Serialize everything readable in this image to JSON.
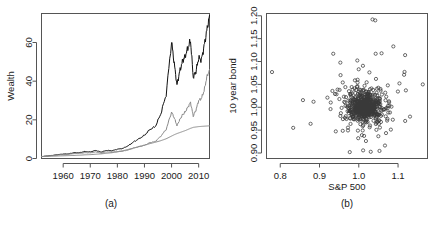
{
  "figure": {
    "panels": [
      {
        "id": "a",
        "caption": "(a)"
      },
      {
        "id": "b",
        "caption": "(b)"
      }
    ]
  },
  "chart_data": [
    {
      "type": "line",
      "panel": "(a)",
      "title": "",
      "xlabel": "",
      "ylabel": "Wealth",
      "xlim": [
        1952,
        2014
      ],
      "ylim": [
        0,
        75
      ],
      "xticks": [
        1960,
        1970,
        1980,
        1990,
        2000,
        2010
      ],
      "yticks": [
        0,
        20,
        40,
        60
      ],
      "grid": false,
      "legend": "none",
      "x": [
        1952,
        1954,
        1956,
        1958,
        1960,
        1962,
        1964,
        1966,
        1968,
        1970,
        1972,
        1974,
        1976,
        1978,
        1980,
        1982,
        1984,
        1986,
        1988,
        1990,
        1992,
        1994,
        1996,
        1998,
        2000,
        2001,
        2002,
        2003,
        2004,
        2005,
        2006,
        2007,
        2008,
        2009,
        2010,
        2011,
        2012,
        2013,
        2014
      ],
      "series": [
        {
          "name": "strategy-black",
          "color": "#111111",
          "values": [
            1.0,
            1.3,
            1.6,
            2.0,
            2.3,
            2.4,
            3.0,
            3.0,
            3.6,
            3.4,
            4.2,
            3.3,
            4.2,
            4.0,
            4.8,
            5.2,
            6.6,
            8.6,
            10.2,
            12.0,
            15.0,
            16.5,
            23.0,
            33.0,
            60.5,
            49.0,
            38.0,
            45.0,
            50.0,
            53.0,
            57.0,
            61.0,
            42.0,
            45.0,
            52.0,
            51.0,
            58.0,
            66.0,
            74.0
          ]
        },
        {
          "name": "strategy-grey-middle",
          "color": "#8a8a8a",
          "values": [
            1.0,
            1.2,
            1.5,
            1.8,
            2.0,
            2.1,
            2.6,
            2.6,
            3.0,
            2.9,
            3.4,
            2.8,
            3.4,
            3.3,
            3.6,
            3.8,
            4.4,
            5.4,
            6.2,
            6.8,
            8.2,
            8.8,
            11.5,
            15.0,
            24.0,
            21.0,
            17.0,
            20.0,
            22.5,
            24.0,
            26.5,
            29.0,
            22.0,
            25.0,
            30.0,
            31.0,
            35.0,
            42.0,
            46.0
          ]
        },
        {
          "name": "strategy-grey-flat",
          "color": "#8a8a8a",
          "values": [
            1.0,
            1.1,
            1.2,
            1.3,
            1.4,
            1.5,
            1.6,
            1.7,
            1.9,
            2.0,
            2.2,
            2.4,
            2.7,
            3.0,
            3.4,
            4.0,
            4.7,
            5.4,
            6.1,
            6.9,
            7.7,
            8.4,
            9.2,
            10.2,
            11.6,
            12.3,
            12.9,
            13.4,
            13.9,
            14.4,
            15.0,
            15.6,
            16.1,
            16.3,
            16.5,
            16.6,
            16.7,
            16.8,
            16.9
          ]
        }
      ]
    },
    {
      "type": "scatter",
      "panel": "(b)",
      "title": "",
      "xlabel": "S&P 500",
      "ylabel": "10 year bond",
      "xlim": [
        0.765,
        1.175
      ],
      "ylim": [
        0.888,
        1.205
      ],
      "xticks": [
        0.8,
        0.9,
        1.0,
        1.1
      ],
      "xticklabels": [
        "0.8",
        "0.9",
        "1.0",
        "1.1"
      ],
      "yticks": [
        0.9,
        0.95,
        1.0,
        1.05,
        1.1,
        1.15,
        1.2
      ],
      "yticklabels": [
        "0.90",
        "0.95",
        "1.00",
        "1.05",
        "1.10",
        "1.15",
        "1.20"
      ],
      "grid": false,
      "legend": "none",
      "marker": "open-circle",
      "n_points": 620,
      "center": [
        1.015,
        1.001
      ],
      "notable_outliers": [
        [
          0.779,
          1.077
        ],
        [
          0.833,
          0.955
        ],
        [
          1.035,
          1.192
        ],
        [
          1.042,
          1.19
        ],
        [
          1.163,
          1.05
        ],
        [
          1.118,
          1.114
        ],
        [
          1.088,
          1.133
        ],
        [
          0.935,
          1.117
        ],
        [
          0.977,
          0.902
        ],
        [
          1.058,
          1.118
        ],
        [
          1.043,
          1.117
        ]
      ]
    }
  ]
}
